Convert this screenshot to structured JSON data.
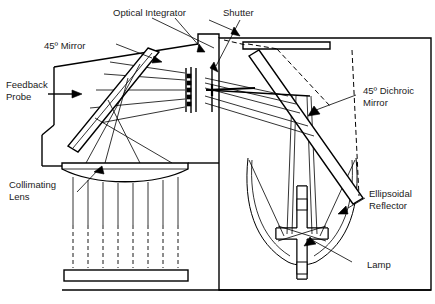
{
  "figure": {
    "background_color": "#ffffff",
    "line_color": "#000000",
    "text_color": "#1a1a1a",
    "width": 435,
    "height": 304
  },
  "labels": {
    "optical_integrator": "Optical Integrator",
    "shutter": "Shutter",
    "mirror_45": "45º Mirror",
    "feedback_probe_line1": "Feedback",
    "feedback_probe_line2": "Probe",
    "dichroic_line1": "45º Dichroic",
    "dichroic_line2": "Mirror",
    "collimating_line1": "Collimating",
    "collimating_line2": "Lens",
    "ellipsoidal_line1": "Ellipsoidal",
    "ellipsoidal_line2": "Reflector",
    "lamp": "Lamp"
  },
  "components": {
    "lamp": "cross-shaped arc lamp with upper and lower electrodes",
    "ellipsoidal_reflector": "ellipsoidal reflector cup surrounding lamp",
    "dichroic_mirror": "45 degree dichroic mirror bar",
    "shutter": "vertical shutter blade",
    "optical_integrator": "lenslet array stack",
    "mirror_45": "45 degree fold mirror bar",
    "feedback_probe": "feedback probe arrow at housing wall",
    "collimating_lens": "plano-convex collimating lens",
    "exit_plate": "illuminated output plate"
  }
}
